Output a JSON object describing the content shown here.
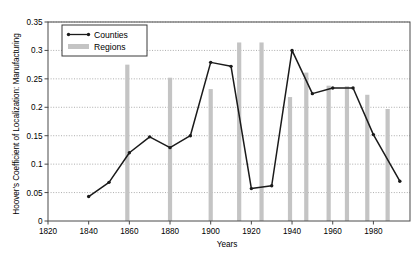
{
  "chart_data": {
    "type": "line",
    "title": "",
    "xlabel": "Years",
    "ylabel": "Hoover's Coefficient of Localization: Manufacturing",
    "xlim": [
      1820,
      1998
    ],
    "ylim": [
      0,
      0.35
    ],
    "xticks": [
      1820,
      1840,
      1860,
      1880,
      1900,
      1920,
      1940,
      1960,
      1980
    ],
    "yticks": [
      0,
      0.05,
      0.1,
      0.15,
      0.2,
      0.25,
      0.3,
      0.35
    ],
    "ytick_labels": [
      "0",
      "0.05",
      "0.1",
      "0.15",
      "0.2",
      "0.25",
      "0.3",
      "0.35"
    ],
    "xtick_labels": [
      "1820",
      "1840",
      "1860",
      "1880",
      "1900",
      "1920",
      "1940",
      "1960",
      "1980"
    ],
    "grid": "horizontal-dotted",
    "legend_position": "top-left",
    "series": [
      {
        "name": "Counties",
        "type": "line",
        "color": "#1a1a1a",
        "marker": "dot",
        "points": [
          {
            "x": 1840,
            "y": 0.043
          },
          {
            "x": 1850,
            "y": 0.068
          },
          {
            "x": 1860,
            "y": 0.12
          },
          {
            "x": 1870,
            "y": 0.148
          },
          {
            "x": 1880,
            "y": 0.129
          },
          {
            "x": 1890,
            "y": 0.15
          },
          {
            "x": 1900,
            "y": 0.279
          },
          {
            "x": 1910,
            "y": 0.272
          },
          {
            "x": 1920,
            "y": 0.057
          },
          {
            "x": 1930,
            "y": 0.062
          },
          {
            "x": 1940,
            "y": 0.3
          },
          {
            "x": 1950,
            "y": 0.224
          },
          {
            "x": 1960,
            "y": 0.234
          },
          {
            "x": 1970,
            "y": 0.234
          },
          {
            "x": 1980,
            "y": 0.152
          },
          {
            "x": 1993,
            "y": 0.07
          }
        ]
      },
      {
        "name": "Regions",
        "type": "bar",
        "color": "#c4c4c4",
        "points": [
          {
            "x": 1859,
            "y": 0.275
          },
          {
            "x": 1880,
            "y": 0.252
          },
          {
            "x": 1900,
            "y": 0.232
          },
          {
            "x": 1914,
            "y": 0.314
          },
          {
            "x": 1925,
            "y": 0.314
          },
          {
            "x": 1939,
            "y": 0.218
          },
          {
            "x": 1947,
            "y": 0.261
          },
          {
            "x": 1958,
            "y": 0.238
          },
          {
            "x": 1967,
            "y": 0.237
          },
          {
            "x": 1977,
            "y": 0.222
          },
          {
            "x": 1987,
            "y": 0.197
          }
        ]
      }
    ],
    "legend": [
      {
        "label": "Counties",
        "marker": "line-dot",
        "color": "#1a1a1a"
      },
      {
        "label": "Regions",
        "marker": "bar-swatch",
        "color": "#c4c4c4"
      }
    ]
  }
}
